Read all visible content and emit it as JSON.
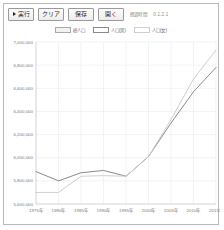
{
  "window": {
    "title": ""
  },
  "toolbar": {
    "buttons": [
      {
        "name": "run",
        "label": "実行",
        "icon": "play-icon"
      },
      {
        "name": "clear",
        "label": "クリア",
        "icon": ""
      },
      {
        "name": "save",
        "label": "保存",
        "icon": ""
      },
      {
        "name": "open",
        "label": "開く",
        "icon": ""
      }
    ],
    "status_label": "経過時間",
    "status_value": "0.1.2.1"
  },
  "legend": {
    "position": "top-center",
    "items": [
      {
        "label": "総人口",
        "color": "#f2f2f2",
        "border": "#a9a9a9"
      },
      {
        "label": "人口(男)",
        "color": "#ffffff",
        "border": "#8a8a8a"
      },
      {
        "label": "人口(女)",
        "color": "#ffffff",
        "border": "#cfcfcf"
      }
    ]
  },
  "chart_data": {
    "type": "line",
    "title": "",
    "xlabel": "",
    "ylabel": "",
    "grid": true,
    "ylim": [
      5600000,
      7000000
    ],
    "ytick_labels": [
      "7,000,000",
      "6,800,000",
      "6,600,000",
      "6,400,000",
      "6,200,000",
      "6,000,000",
      "5,800,000",
      "5,600,000"
    ],
    "ytick_values": [
      7000000,
      6800000,
      6600000,
      6400000,
      6200000,
      6000000,
      5800000,
      5600000
    ],
    "categories": [
      "1975年",
      "1980年",
      "1985年",
      "1990年",
      "1995年",
      "2000年",
      "2005年",
      "2010年",
      "2015年"
    ],
    "series": [
      {
        "name": "人口(男)",
        "color": "#8a8a8a",
        "values": [
          5880000,
          5800000,
          5870000,
          5890000,
          5840000,
          6010000,
          6300000,
          6570000,
          6780000
        ]
      },
      {
        "name": "人口(女)",
        "color": "#cfcfcf",
        "values": [
          5700000,
          5700000,
          5840000,
          5845000,
          5840000,
          6010000,
          6330000,
          6680000,
          6930000
        ]
      }
    ]
  }
}
